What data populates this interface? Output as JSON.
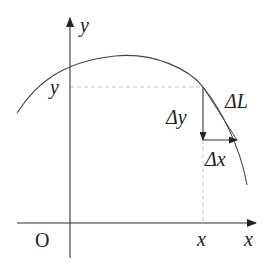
{
  "diagram": {
    "axes": {
      "x_label": "x",
      "y_label": "y",
      "origin_label": "O"
    },
    "point_labels": {
      "x_tick": "x",
      "y_tick": "y"
    },
    "increments": {
      "dy_label": "Δy",
      "dx_label": "Δx",
      "dl_label": "ΔL"
    },
    "colors": {
      "stroke": "#333333",
      "dashed": "#bdbdbd",
      "background": "#ffffff"
    }
  }
}
